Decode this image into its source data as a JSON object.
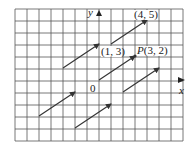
{
  "figure": {
    "grid": {
      "left": 15,
      "top": 9,
      "cell": 12,
      "cols": 14,
      "rows": 11,
      "line_color": "#555555"
    },
    "origin_px": {
      "x": 99,
      "y": 80
    },
    "axes": {
      "x_label": "x",
      "y_label": "y",
      "origin_label": "0"
    },
    "vectors": [
      {
        "from": [
          -3,
          1
        ],
        "to": [
          0,
          3
        ]
      },
      {
        "from": [
          1,
          3
        ],
        "to": [
          4,
          5
        ]
      },
      {
        "from": [
          0,
          0
        ],
        "to": [
          3,
          2
        ]
      },
      {
        "from": [
          2,
          -1
        ],
        "to": [
          5,
          1
        ]
      },
      {
        "from": [
          -5,
          -3
        ],
        "to": [
          -2,
          -1
        ]
      },
      {
        "from": [
          -2,
          -4
        ],
        "to": [
          1,
          -2
        ]
      }
    ],
    "labels": {
      "point_1_3": "(1, 3)",
      "point_4_5": "(4, 5)",
      "point_P_name": "P",
      "point_P_coords": "(3, 2)"
    },
    "colors": {
      "vector": "#333333",
      "text": "#222222",
      "background": "#ffffff"
    }
  }
}
